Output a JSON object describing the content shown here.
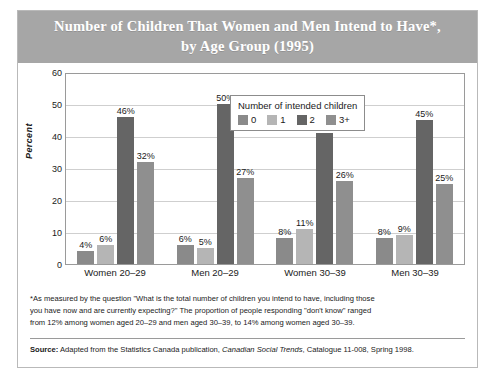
{
  "figure": {
    "title": "Number of Children That Women and Men Intend to Have*, by Age Group (1995)",
    "title_line1": "Number of Children That Women and Men Intend to Have*,",
    "title_line2": "by Age Group (1995)",
    "title_band_color": "#a6a6a6"
  },
  "legend": {
    "title": "Number of intended children",
    "items": [
      {
        "label": "0",
        "color": "#8a8a8a"
      },
      {
        "label": "1",
        "color": "#b5b5b5"
      },
      {
        "label": "2",
        "color": "#656565"
      },
      {
        "label": "3+",
        "color": "#8f8f8f"
      }
    ]
  },
  "footnote": {
    "marker": "*",
    "line1": "*As measured by the question \"What is the total number of children you intend to have, including those",
    "line2": "you have now and are currently expecting?\" The proportion of people responding \"don't know\" ranged",
    "line3": "from 12% among women aged 20–29 and men aged 30–39, to 14% among women aged 30–39."
  },
  "source": {
    "label": "Source:",
    "text_before": " Adapted from the Statistics Canada publication, ",
    "publication": "Canadian Social Trends",
    "text_after": ", Catalogue 11-008, Spring 1998."
  },
  "chart_data": {
    "type": "bar",
    "title": "Number of Children That Women and Men Intend to Have*, by Age Group (1995)",
    "xlabel": "",
    "ylabel": "Percent",
    "ylim": [
      0,
      60
    ],
    "yticks": [
      0,
      10,
      20,
      30,
      40,
      50,
      60
    ],
    "ytick_labels": [
      "0",
      "10",
      "20",
      "30",
      "40",
      "50",
      "60"
    ],
    "grid": "horizontal",
    "legend_position": "inside-top-center",
    "legend_title": "Number of intended children",
    "categories": [
      "Women 20–29",
      "Men 20–29",
      "Women 30–39",
      "Men 30–39"
    ],
    "series": [
      {
        "name": "0",
        "color": "#8a8a8a",
        "values": [
          4,
          6,
          8,
          8
        ],
        "labels": [
          "4%",
          "6%",
          "8%",
          "8%"
        ]
      },
      {
        "name": "1",
        "color": "#b5b5b5",
        "values": [
          6,
          5,
          11,
          9
        ],
        "labels": [
          "6%",
          "5%",
          "11%",
          "9%"
        ]
      },
      {
        "name": "2",
        "color": "#656565",
        "values": [
          46,
          50,
          41,
          45
        ],
        "labels": [
          "46%",
          "50%",
          "41%",
          "45%"
        ]
      },
      {
        "name": "3+",
        "color": "#8f8f8f",
        "values": [
          32,
          27,
          26,
          25
        ],
        "labels": [
          "32%",
          "27%",
          "26%",
          "25%"
        ]
      }
    ]
  }
}
